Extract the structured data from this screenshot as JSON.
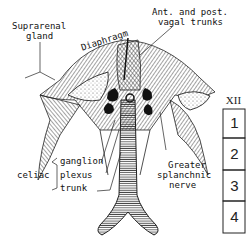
{
  "labels": {
    "suprarenal": [
      "Suprarenal",
      "gland"
    ],
    "diaphragm": "Diaphragm",
    "vagal": [
      "Ant. and post.",
      "vagal trunks"
    ],
    "celiac": "celiac",
    "celiac_parts": [
      "ganglion",
      "plexus",
      "trunk"
    ],
    "splanchnic": [
      "Greater",
      "splanchnic",
      "nerve"
    ]
  },
  "vertebrae": [
    "XII",
    "1",
    "2",
    "3",
    "4"
  ],
  "colors": {
    "ink": "#111111",
    "paper": "#ffffff"
  }
}
